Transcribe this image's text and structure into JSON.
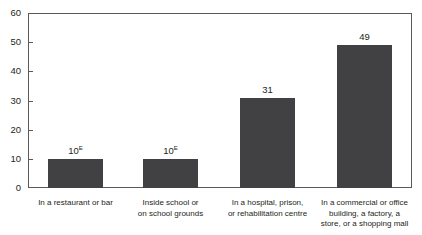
{
  "chart_data": {
    "type": "bar",
    "title": "",
    "subtitle": "",
    "xlabel": "",
    "ylabel": "",
    "ylim": [
      0,
      60
    ],
    "yticks": [
      0,
      10,
      20,
      30,
      40,
      50,
      60
    ],
    "grid": false,
    "legend": null,
    "bar_color": "#414042",
    "axis_color": "#58595b",
    "text_color": "#231f20",
    "categories": [
      "In a restaurant or bar",
      "Inside school or\non school grounds",
      "In a hospital, prison,\nor rehabilitation centre",
      "In a commercial or office\nbuilding, a factory, a\nstore, or a shopping mall"
    ],
    "category_lines": [
      [
        "In a restaurant or bar"
      ],
      [
        "Inside school or",
        "on school grounds"
      ],
      [
        "In a hospital, prison,",
        "or rehabilitation centre"
      ],
      [
        "In a commercial or office",
        "building, a factory, a",
        "store, or a shopping mall"
      ]
    ],
    "values": [
      10,
      10,
      31,
      49
    ],
    "value_labels": [
      "10",
      "10",
      "31",
      "49"
    ],
    "value_superscripts": [
      "E",
      "E",
      "",
      ""
    ],
    "bars": [
      {
        "label": "10",
        "superscript": "E",
        "value": 10
      },
      {
        "label": "10",
        "superscript": "E",
        "value": 10
      },
      {
        "label": "31",
        "superscript": "",
        "value": 31
      },
      {
        "label": "49",
        "superscript": "",
        "value": 49
      }
    ]
  },
  "axis": {
    "tick_labels": [
      "60",
      "50",
      "40",
      "30",
      "20",
      "10",
      "0"
    ]
  }
}
